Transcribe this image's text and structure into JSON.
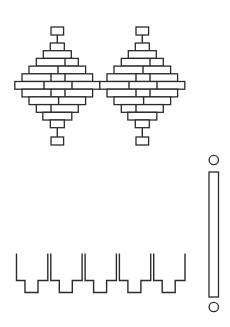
{
  "diagram": {
    "type": "pattern-diagram",
    "stroke_color": "#2b2b2b",
    "background": "#ffffff",
    "brick_diamonds": {
      "count": 2,
      "centers_x": [
        57.3,
        142.3
      ],
      "row_height": 7.7,
      "top_box": {
        "y": 27,
        "h": 8,
        "half_width": 6.3
      },
      "bottom_box": {
        "y": 137,
        "h": 8,
        "half_width": 6.3
      },
      "rows": [
        {
          "y": 43,
          "half": 7,
          "dividers": []
        },
        {
          "y": 50.7,
          "half": 14,
          "dividers": []
        },
        {
          "y": 58.4,
          "half": 21,
          "dividers": [
            7.7
          ]
        },
        {
          "y": 66.1,
          "half": 28.3,
          "dividers": [
            0.7
          ]
        },
        {
          "y": 73.8,
          "half": 35.3,
          "dividers": [
            -6.3,
            7.7
          ]
        },
        {
          "y": 81.5,
          "half": 42.5,
          "dividers": [
            -13.3,
            14.7
          ]
        },
        {
          "y": 89.2,
          "half": 35.3,
          "dividers": [
            -6.3,
            7.7
          ]
        },
        {
          "y": 96.9,
          "half": 28.3,
          "dividers": [
            1.3
          ]
        },
        {
          "y": 104.6,
          "half": 21,
          "dividers": [
            -6.3
          ]
        },
        {
          "y": 112.3,
          "half": 14.5,
          "dividers": []
        },
        {
          "y": 120,
          "half": 7,
          "dividers": []
        }
      ]
    },
    "notched_strip": {
      "units": 5,
      "start_x": [
        16.5,
        50.8,
        85.1,
        119.4,
        153.7
      ],
      "unit_width": 31.3,
      "top_y": 253.5,
      "step_y": 280.5,
      "bottom_y": 292.5,
      "notch_left_offset": 8.5,
      "notch_right_offset": 21.5
    },
    "vertical_bar": {
      "x": 209,
      "y": 172,
      "w": 9.5,
      "h": 125,
      "top_circle": {
        "cx": 213.8,
        "cy": 160,
        "r": 4.7
      },
      "bottom_circle": {
        "cx": 213.8,
        "cy": 307,
        "r": 4.7
      }
    }
  }
}
